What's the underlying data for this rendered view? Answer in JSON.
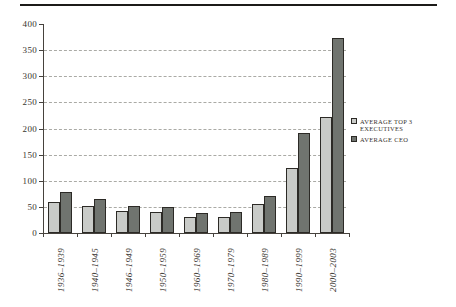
{
  "chart_data": {
    "type": "bar",
    "title": "",
    "xlabel": "",
    "ylabel": "",
    "categories": [
      "1936–1939",
      "1940–1945",
      "1946–1949",
      "1950–1959",
      "1960–1969",
      "1970–1979",
      "1980–1989",
      "1990–1999",
      "2000–2003"
    ],
    "series": [
      {
        "name": "AVERAGE TOP 3 EXECUTIVES",
        "color": "#c9cbc8",
        "values": [
          59,
          51,
          43,
          40,
          31,
          31,
          56,
          124,
          222
        ]
      },
      {
        "name": "AVERAGE CEO",
        "color": "#70746f",
        "values": [
          79,
          65,
          52,
          50,
          38,
          40,
          71,
          192,
          373
        ]
      }
    ],
    "ylim": [
      0,
      400
    ],
    "yticks": [
      0,
      50,
      100,
      150,
      200,
      250,
      300,
      350,
      400
    ],
    "grid": "horizontal-dashed",
    "legend_position": "right-middle",
    "bar_border_color": "#2c2a26",
    "axis_color": "#46423d",
    "gridline_color": "#aaaaa5",
    "text_color": "#38342e"
  }
}
